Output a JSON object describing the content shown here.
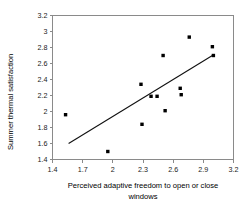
{
  "chart_data": {
    "type": "scatter",
    "title": "",
    "xlabel": "Perceived adaptive freedom to open or close windows",
    "ylabel": "Summer thermal satisfaction",
    "xlim": [
      1.4,
      3.2
    ],
    "ylim": [
      1.4,
      3.2
    ],
    "xticks": [
      "1.4",
      "1.7",
      "2",
      "2.3",
      "2.6",
      "2.9",
      "3.2"
    ],
    "xtick_values": [
      1.4,
      1.7,
      2,
      2.3,
      2.6,
      2.9,
      3.2
    ],
    "yticks": [
      "1.4",
      "1.6",
      "1.8",
      "2",
      "2.2",
      "2.4",
      "2.6",
      "2.8",
      "3",
      "3.2"
    ],
    "ytick_values": [
      1.4,
      1.6,
      1.8,
      2.0,
      2.2,
      2.4,
      2.6,
      2.8,
      3.0,
      3.2
    ],
    "grid": false,
    "legend": false,
    "marker": "square",
    "marker_color": "#000000",
    "points": [
      {
        "x": 1.53,
        "y": 1.96
      },
      {
        "x": 1.95,
        "y": 1.5
      },
      {
        "x": 2.28,
        "y": 2.34
      },
      {
        "x": 2.29,
        "y": 1.84
      },
      {
        "x": 2.38,
        "y": 2.19
      },
      {
        "x": 2.44,
        "y": 2.19
      },
      {
        "x": 2.5,
        "y": 2.7
      },
      {
        "x": 2.52,
        "y": 2.01
      },
      {
        "x": 2.67,
        "y": 2.29
      },
      {
        "x": 2.68,
        "y": 2.21
      },
      {
        "x": 2.76,
        "y": 2.93
      },
      {
        "x": 2.99,
        "y": 2.81
      },
      {
        "x": 3.0,
        "y": 2.7
      }
    ],
    "trendline": {
      "type": "linear-fit",
      "x_start": 1.56,
      "y_start": 1.6,
      "x_end": 2.99,
      "y_end": 2.7
    }
  },
  "axis_labels": {
    "x_line1": "Perceived adaptive freedom to open or close",
    "x_line2": "windows",
    "y": "Summer thermal satisfaction"
  }
}
